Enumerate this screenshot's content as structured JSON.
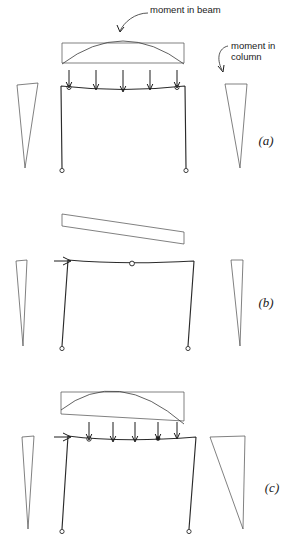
{
  "figure": {
    "kind": "structural-bending-moment-diagram",
    "stroke_color": "#2b2b2b",
    "background_color": "#ffffff"
  },
  "annotations": {
    "beam_label": "moment in beam",
    "column_label_line1": "moment in",
    "column_label_line2": "column"
  },
  "panels": [
    {
      "id": "a",
      "label": "(a)",
      "case": "gravity load on beam, no sway",
      "beam_moment": {
        "shape": "parabola over rectangle",
        "symmetry": "symmetric",
        "left_end_moment": 1.0,
        "right_end_moment": 1.0,
        "midspan_moment": 1.0
      },
      "column_moments": {
        "left": {
          "top": 1.0,
          "bottom": 0.0,
          "shape": "triangle"
        },
        "right": {
          "top": 1.0,
          "bottom": 0.0,
          "shape": "triangle"
        }
      },
      "loads": {
        "vertical_arrow_count": 5,
        "horizontal_arrow": false
      },
      "hinges": 2,
      "supports": "pinned"
    },
    {
      "id": "b",
      "label": "(b)",
      "case": "lateral sway load at beam level",
      "beam_moment": {
        "shape": "antisymmetric bowtie",
        "symmetry": "antisymmetric",
        "left_end_moment": 1.0,
        "right_end_moment": -1.0,
        "midspan_moment": 0.0
      },
      "column_moments": {
        "left": {
          "top": 0.45,
          "bottom": 0.0,
          "shape": "narrow triangle"
        },
        "right": {
          "top": 0.45,
          "bottom": 0.0,
          "shape": "narrow triangle"
        }
      },
      "loads": {
        "vertical_arrow_count": 0,
        "horizontal_arrow": true
      },
      "hinges": 1,
      "supports": "pinned"
    },
    {
      "id": "c",
      "label": "(c)",
      "case": "combined gravity plus sway",
      "beam_moment": {
        "shape": "skewed parabola over rectangle",
        "symmetry": "asymmetric",
        "left_end_moment": 0.3,
        "right_end_moment": 1.8,
        "midspan_moment": 1.0
      },
      "column_moments": {
        "left": {
          "top": 0.35,
          "bottom": 0.0,
          "shape": "narrow triangle"
        },
        "right": {
          "top": 1.8,
          "bottom": 0.0,
          "shape": "wide triangle"
        }
      },
      "loads": {
        "vertical_arrow_count": 5,
        "horizontal_arrow": true
      },
      "hinges": 2,
      "supports": "pinned"
    }
  ]
}
